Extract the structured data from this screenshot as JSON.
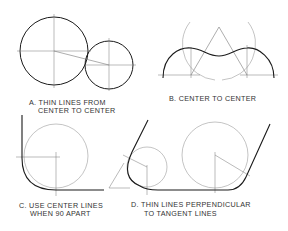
{
  "figures": [
    {
      "id": "A",
      "caption_line1": "A. THIN LINES FROM",
      "caption_line2": "CENTER TO CENTER"
    },
    {
      "id": "B",
      "caption_line1": "B. CENTER TO CENTER",
      "caption_line2": ""
    },
    {
      "id": "C",
      "caption_line1": "C. USE CENTER LINES",
      "caption_line2": "WHEN 90 APART"
    },
    {
      "id": "D",
      "caption_line1": "D. THIN LINES PERPENDICULAR",
      "caption_line2": "TO TANGENT LINES"
    }
  ],
  "colors": {
    "thick_line": "#1a1a1a",
    "thin_line": "#777777",
    "text": "#333333"
  }
}
